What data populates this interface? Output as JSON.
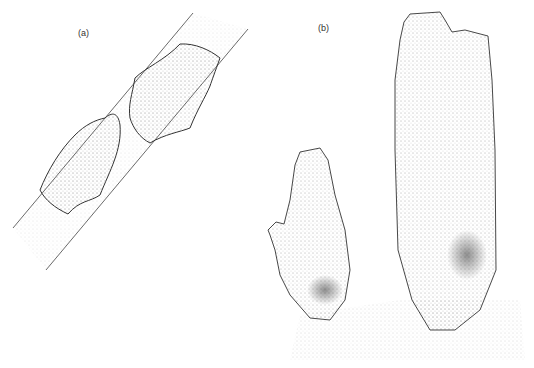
{
  "figure": {
    "panels": [
      {
        "label": "(a)",
        "x": 78,
        "y": 28
      },
      {
        "label": "(b)",
        "x": 318,
        "y": 23
      }
    ],
    "colors": {
      "ink": "#333333",
      "background": "#ffffff",
      "stipple": "#555555"
    }
  }
}
